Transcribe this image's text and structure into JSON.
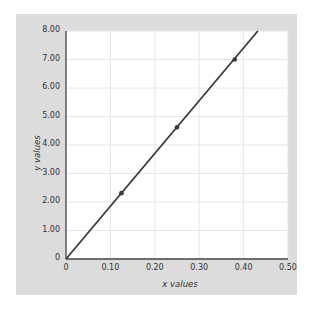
{
  "chart_data": {
    "type": "line",
    "title": "",
    "xlabel": "x values",
    "ylabel": "y values",
    "xlim": [
      0,
      0.5
    ],
    "ylim": [
      0,
      8
    ],
    "grid": true,
    "x_ticks": [
      "0",
      "0.10",
      "0.20",
      "0.30",
      "0.40",
      "0.50"
    ],
    "y_ticks": [
      "0",
      "1.00",
      "2.00",
      "3.00",
      "4.00",
      "5.00",
      "6.00",
      "7.00",
      "8.00"
    ],
    "series": [
      {
        "name": "data",
        "points": [
          {
            "x": 0.125,
            "y": 2.31
          },
          {
            "x": 0.25,
            "y": 4.62
          },
          {
            "x": 0.38,
            "y": 7.0
          }
        ],
        "fit_line": {
          "x_start": 0,
          "y_start": 0,
          "x_end": 0.432,
          "y_end": 8.0,
          "slope": 18.5
        }
      }
    ],
    "colors": {
      "line": "#3a3a3a",
      "panel": "#dcdcdc",
      "plot_bg": "#ffffff",
      "grid": "#e6e6e6"
    }
  },
  "labels": {
    "x_axis": "x values",
    "y_axis": "y values"
  }
}
